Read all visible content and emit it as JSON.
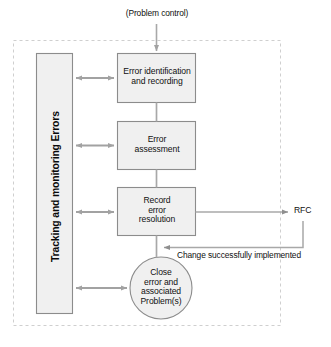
{
  "diagram": {
    "boundary": {
      "style": "dashed",
      "color": "#cccccc",
      "label": ""
    },
    "colors": {
      "box_fill": "#f0f0f0",
      "box_stroke": "#888888",
      "arrow_gray": "#9a9a9a",
      "connector_gray": "#a8a8a8",
      "dashed_border": "#cfcfcf",
      "text": "#101010"
    },
    "swimlane": {
      "label": "Tracking and monitoring Errors"
    },
    "entry": {
      "label": "(Problem control)"
    },
    "nodes": [
      {
        "id": "error-identification-and-recording",
        "shape": "rect",
        "label": "Error identification\nand recording"
      },
      {
        "id": "error-assessment",
        "shape": "rect",
        "label": "Error\nassessment"
      },
      {
        "id": "record-error-resolution",
        "shape": "rect",
        "label": "Record\nerror\nresolution"
      },
      {
        "id": "close-error-and-associated-problems",
        "shape": "circle",
        "label": "Close\nerror and\nassociated\nProblem(s)"
      }
    ],
    "external": {
      "rfc_label": "RFC"
    },
    "edges": [
      {
        "id": "problem-control-to-identification",
        "label": ""
      },
      {
        "id": "identification-to-assessment",
        "label": ""
      },
      {
        "id": "assessment-to-record",
        "label": ""
      },
      {
        "id": "record-to-close",
        "label": ""
      },
      {
        "id": "record-to-rfc",
        "label": ""
      },
      {
        "id": "rfc-to-close",
        "label": "Change successfully implemented"
      },
      {
        "id": "swimlane-to-identification",
        "label": ""
      },
      {
        "id": "swimlane-to-assessment",
        "label": ""
      },
      {
        "id": "swimlane-to-record",
        "label": ""
      },
      {
        "id": "swimlane-to-close",
        "label": ""
      }
    ]
  }
}
